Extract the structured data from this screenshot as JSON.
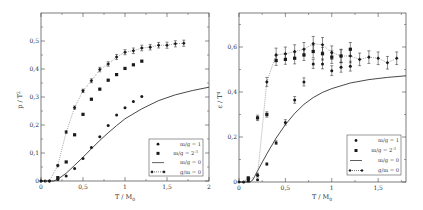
{
  "chart_data": [
    {
      "type": "scatter",
      "panel": "left",
      "xlabel": "T / M_0",
      "ylabel": "p / T^2",
      "xlim": [
        0,
        2
      ],
      "ylim": [
        0,
        0.58
      ],
      "xticks": [
        "0",
        "0,5",
        "1",
        "1,5",
        "2"
      ],
      "xtick_values": [
        0,
        0.5,
        1,
        1.5,
        2
      ],
      "yticks": [
        "0",
        "0,1",
        "0,2",
        "0,3",
        "0,4",
        "0,5"
      ],
      "ytick_values": [
        0,
        0.1,
        0.2,
        0.3,
        0.4,
        0.5
      ],
      "grid": false,
      "legend_position": "lower right",
      "series": [
        {
          "name": "m/g = 1",
          "marker": "circle",
          "line": "none",
          "x": [
            0,
            0.05,
            0.1,
            0.2,
            0.3,
            0.4,
            0.5,
            0.6,
            0.7,
            0.8,
            0.9,
            1.0,
            1.1,
            1.2
          ],
          "y": [
            0,
            0,
            0,
            0.005,
            0.018,
            0.045,
            0.08,
            0.12,
            0.158,
            0.198,
            0.236,
            0.262,
            0.284,
            0.302
          ]
        },
        {
          "name": "m/g = 2^-3",
          "marker": "square",
          "line": "none",
          "x": [
            0.2,
            0.3,
            0.4,
            0.5,
            0.6,
            0.7,
            0.8,
            0.9,
            1.0,
            1.1,
            1.2
          ],
          "y": [
            0.012,
            0.068,
            0.165,
            0.238,
            0.292,
            0.328,
            0.36,
            0.38,
            0.402,
            0.415,
            0.428
          ]
        },
        {
          "name": "m/g = 0",
          "marker": "none",
          "line": "solid",
          "x": [
            0,
            0.15,
            0.2,
            0.3,
            0.4,
            0.5,
            0.6,
            0.7,
            0.8,
            0.9,
            1.0,
            1.2,
            1.4,
            1.6,
            1.8,
            2.0
          ],
          "y": [
            0,
            0,
            0.006,
            0.028,
            0.056,
            0.085,
            0.115,
            0.145,
            0.172,
            0.198,
            0.222,
            0.258,
            0.287,
            0.308,
            0.323,
            0.335
          ]
        },
        {
          "name": "g/m = 0",
          "marker": "diamond",
          "line": "dotted",
          "errorbars": true,
          "x": [
            0,
            0.1,
            0.2,
            0.3,
            0.4,
            0.5,
            0.6,
            0.7,
            0.8,
            0.9,
            1.0,
            1.1,
            1.2,
            1.3,
            1.4,
            1.5,
            1.6,
            1.7
          ],
          "y": [
            0,
            0,
            0.055,
            0.175,
            0.262,
            0.322,
            0.358,
            0.398,
            0.418,
            0.443,
            0.46,
            0.465,
            0.475,
            0.478,
            0.485,
            0.485,
            0.49,
            0.492
          ],
          "err": [
            0,
            0,
            0.004,
            0.005,
            0.006,
            0.006,
            0.007,
            0.008,
            0.008,
            0.009,
            0.009,
            0.01,
            0.01,
            0.01,
            0.01,
            0.011,
            0.011,
            0.011
          ]
        }
      ]
    },
    {
      "type": "scatter",
      "panel": "right",
      "xlabel": "T / M_0",
      "ylabel": "ε / T^4",
      "xlim": [
        0,
        1.8
      ],
      "ylim": [
        0,
        0.75
      ],
      "xticks": [
        "0",
        "0,5",
        "1",
        "1,5"
      ],
      "xtick_values": [
        0,
        0.5,
        1,
        1.5
      ],
      "yticks": [
        "0",
        "0,2",
        "0,4",
        "0,6"
      ],
      "ytick_values": [
        0,
        0.2,
        0.4,
        0.6
      ],
      "grid": false,
      "legend_position": "lower right",
      "series": [
        {
          "name": "m/g = 1",
          "marker": "circle",
          "line": "none",
          "x": [
            0.05,
            0.1,
            0.1,
            0.2,
            0.2,
            0.3,
            0.4,
            0.5,
            0.6,
            0.7,
            0.8,
            0.9,
            1.0,
            1.1,
            1.2
          ],
          "y": [
            0,
            0.005,
            0.01,
            0.01,
            0.03,
            0.08,
            0.175,
            0.265,
            0.365,
            0.445,
            0.525,
            0.525,
            0.495,
            0.51,
            0.515
          ],
          "err": [
            0,
            0,
            0,
            0,
            0,
            0.005,
            0.008,
            0.012,
            0.015,
            0.018,
            0.02,
            0.022,
            0.022,
            0.022,
            0.022
          ]
        },
        {
          "name": "m/g = 2^-3",
          "marker": "square",
          "line": "none",
          "x": [
            0.1,
            0.2,
            0.3,
            0.4,
            0.5,
            0.6,
            0.7,
            0.8,
            0.9,
            1.0,
            1.1,
            1.2
          ],
          "y": [
            0.018,
            0.285,
            0.3,
            0.54,
            0.545,
            0.55,
            0.565,
            0.58,
            0.57,
            0.555,
            0.56,
            0.59
          ],
          "err": [
            0.004,
            0.012,
            0.012,
            0.022,
            0.022,
            0.025,
            0.025,
            0.028,
            0.028,
            0.028,
            0.028,
            0.03
          ]
        },
        {
          "name": "m/g = 0",
          "marker": "none",
          "line": "solid",
          "x": [
            0,
            0.12,
            0.15,
            0.2,
            0.3,
            0.4,
            0.5,
            0.6,
            0.7,
            0.8,
            0.9,
            1.0,
            1.2,
            1.4,
            1.6,
            1.8
          ],
          "y": [
            0,
            0,
            0.01,
            0.05,
            0.125,
            0.195,
            0.255,
            0.305,
            0.345,
            0.375,
            0.398,
            0.415,
            0.44,
            0.455,
            0.465,
            0.472
          ]
        },
        {
          "name": "g/m = 0",
          "marker": "diamond",
          "line": "dotted",
          "errorbars": true,
          "x": [
            0,
            0.1,
            0.2,
            0.3,
            0.4,
            0.5,
            0.6,
            0.7,
            0.8,
            0.9,
            1.0,
            1.1,
            1.2,
            1.3,
            1.4,
            1.5,
            1.6,
            1.7
          ],
          "y": [
            0,
            0.01,
            0.03,
            0.445,
            0.565,
            0.57,
            0.58,
            0.59,
            0.615,
            0.61,
            0.575,
            0.56,
            0.56,
            0.545,
            0.555,
            0.55,
            0.53,
            0.55
          ],
          "err": [
            0,
            0.005,
            0.008,
            0.02,
            0.03,
            0.03,
            0.03,
            0.03,
            0.032,
            0.032,
            0.03,
            0.03,
            0.03,
            0.028,
            0.028,
            0.028,
            0.028,
            0.028
          ]
        }
      ]
    }
  ],
  "legend": {
    "items": [
      {
        "label": "m/g = 1",
        "symbol": "circle"
      },
      {
        "label": "m/g = 2",
        "sup": "-3",
        "symbol": "square"
      },
      {
        "label": "m/g = 0",
        "symbol": "line"
      },
      {
        "label": "g/m = 0",
        "symbol": "diamond-line"
      }
    ]
  },
  "left": {
    "ylabel": "p / T",
    "ylabel_sup": "2",
    "xlabel": "T / M",
    "xlabel_sub": "0"
  },
  "right": {
    "ylabel": "ε / T",
    "ylabel_sup": "4",
    "xlabel": "T / M",
    "xlabel_sub": "0"
  },
  "colors": {
    "ink": "#1a1a1a",
    "dotted": "#888888",
    "axis": "#444444"
  }
}
